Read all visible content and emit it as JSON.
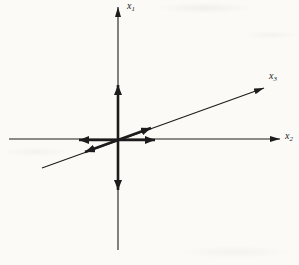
{
  "figure": {
    "colors": {
      "ink": "#1c1c1c",
      "background": "#fbfaf7"
    },
    "axes": {
      "x1": {
        "main": "x",
        "sub": "1"
      },
      "x2": {
        "main": "x",
        "sub": "2"
      },
      "x3": {
        "main": "x",
        "sub": "3"
      }
    },
    "vectors": [
      "plus-x1",
      "minus-x1",
      "plus-x2",
      "minus-x2",
      "plus-x3",
      "minus-x3"
    ]
  }
}
